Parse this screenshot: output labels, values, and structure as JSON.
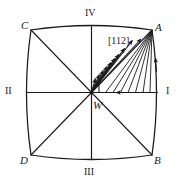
{
  "figure": {
    "type": "crystallographic-standard-projection-diagram",
    "background_color": "#ffffff",
    "line_color": "#1a1a1a",
    "canvas": {
      "width": 178,
      "height": 185
    },
    "shape": {
      "name": "cushion-square",
      "description": "square with outward-bulging curved sides",
      "corners": {
        "C": {
          "x": 31,
          "y": 30
        },
        "A": {
          "x": 152,
          "y": 30
        },
        "D": {
          "x": 31,
          "y": 155
        },
        "B": {
          "x": 152,
          "y": 155
        }
      },
      "center": {
        "x": 91.5,
        "y": 92.5
      },
      "bulge": 9
    },
    "corner_labels": [
      {
        "id": "C",
        "text": "C",
        "x": 21,
        "y": 20
      },
      {
        "id": "A",
        "text": "A",
        "x": 155,
        "y": 22
      },
      {
        "id": "D",
        "text": "D",
        "x": 20,
        "y": 155
      },
      {
        "id": "B",
        "text": "B",
        "x": 154,
        "y": 155
      }
    ],
    "axis_labels": [
      {
        "id": "IV",
        "text": "IV",
        "x": 85,
        "y": 8,
        "position": "top"
      },
      {
        "id": "II",
        "text": "II",
        "x": 5,
        "y": 86,
        "position": "left"
      },
      {
        "id": "I",
        "text": "I",
        "x": 166,
        "y": 86,
        "position": "right"
      },
      {
        "id": "III",
        "text": "III",
        "x": 84,
        "y": 167,
        "position": "bottom"
      }
    ],
    "center_label": {
      "id": "W",
      "text": "W",
      "x": 93,
      "y": 100
    },
    "direction_label": {
      "id": "112",
      "text": "[112]",
      "x": 108,
      "y": 36
    },
    "fan": {
      "origin": {
        "x": 91.5,
        "y": 92.5
      },
      "target_corner": {
        "x": 152,
        "y": 30
      },
      "ray_count": 10,
      "arrowheads_on_diagonal": 10,
      "description": "fan of rays from center W terminating with arrowheads along the W-to-A diagonal, plus rays converging at corner A"
    },
    "extra_arrows": [
      {
        "id": "arrow-horizontal-WI",
        "on": "W-I axis",
        "direction": "left"
      },
      {
        "id": "arrow-right-edge",
        "on": "A-B right edge",
        "direction": "up"
      },
      {
        "id": "arrow-vertical-near-W",
        "on": "near W",
        "direction": "up"
      }
    ]
  }
}
